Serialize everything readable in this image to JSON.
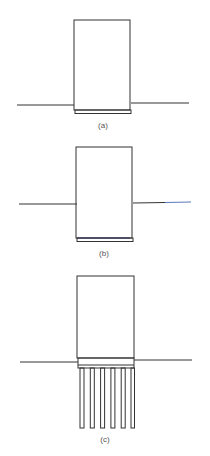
{
  "figures": [
    {
      "id": "a",
      "label": "(a)",
      "description": "Block on thin base slab at ground level",
      "ground_y_left": 105,
      "ground_y_right": 103,
      "ground_x": [
        17,
        189
      ],
      "box": {
        "x": 74,
        "y": 20,
        "w": 56,
        "h": 90
      },
      "slab": {
        "x": 75,
        "y": 110,
        "w": 56,
        "h": 4
      },
      "label_pos": {
        "x": 103,
        "y": 128
      }
    },
    {
      "id": "b",
      "label": "(b)",
      "description": "Block embedded below ground on base slab",
      "ground_y_left": 204,
      "ground_y_right": 202,
      "ground_x": [
        19,
        191
      ],
      "box": {
        "x": 76,
        "y": 147,
        "w": 56,
        "h": 91
      },
      "slab": {
        "x": 77,
        "y": 238,
        "w": 56,
        "h": 4
      },
      "slab_line_color": "#3a3aa0",
      "ground_right_color": "#5a78c0",
      "label_pos": {
        "x": 104,
        "y": 256
      }
    },
    {
      "id": "c",
      "label": "(c)",
      "description": "Block on pile cap supported by six piles",
      "ground_y_left": 362,
      "ground_y_right": 360,
      "ground_x": [
        20,
        192
      ],
      "box": {
        "x": 77,
        "y": 276,
        "w": 57,
        "h": 82
      },
      "slab": {
        "x": 78,
        "y": 358,
        "w": 56,
        "h": 10
      },
      "piles": {
        "count": 6,
        "x_start": 80,
        "spacing": 10.3,
        "width": 4,
        "top": 368,
        "bottom": 428
      },
      "label_pos": {
        "x": 105,
        "y": 442
      }
    }
  ],
  "colors": {
    "stroke": "#333333",
    "label": "#555555",
    "background": "#ffffff"
  }
}
